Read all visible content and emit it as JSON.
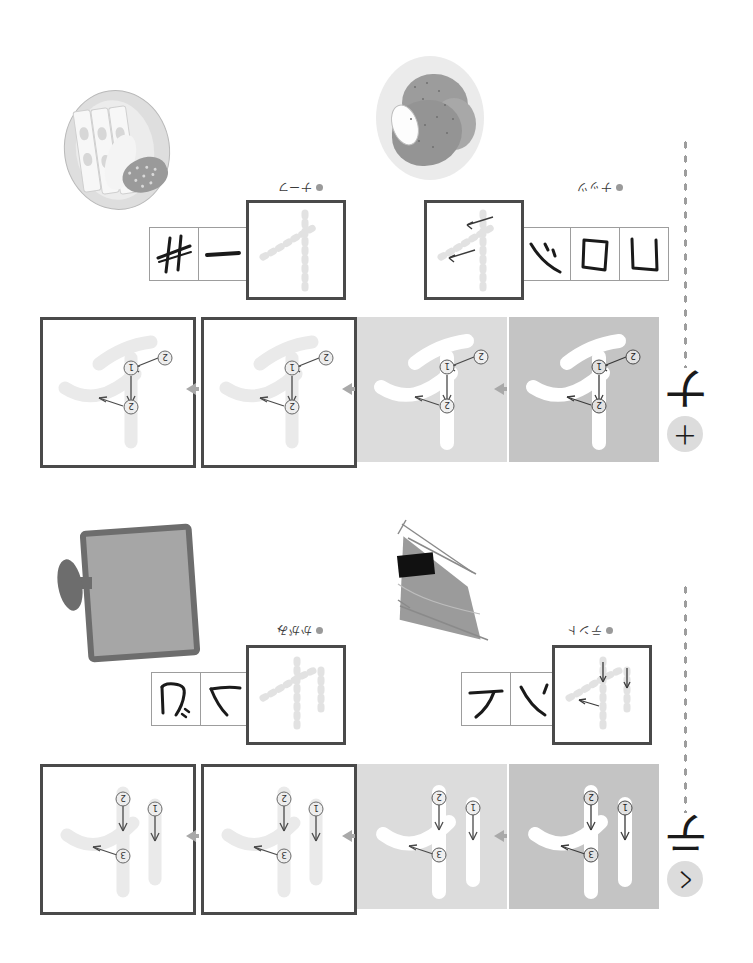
{
  "document": {
    "title": "Katakana stroke-order practice sheet",
    "orientation": "rotated-180",
    "background_color": "#ffffff"
  },
  "colors": {
    "ink": "#1a1a1a",
    "box_border": "#4a4a4a",
    "cell_border": "#9d9d9d",
    "ghost_stroke": "#e9e9e9",
    "panel_light": "#dcdcdc",
    "panel_dark": "#c4c4c4",
    "arrow": "#a9a9a9",
    "bullet": "#9a9a9a"
  },
  "sections": [
    {
      "id": "na",
      "headword": "ナ",
      "badge": "十",
      "illustrations": [
        {
          "name": "plate-with-sliced-food",
          "label": "＋ーカ"
        },
        {
          "name": "bread-on-oval-plate",
          "label": "ナッツ"
        }
      ],
      "word_labels": [
        {
          "text": "ナーフ",
          "bullet": true
        },
        {
          "text": "ナッツ",
          "bullet": true
        }
      ],
      "component_rows": [
        {
          "cells": [
            "井",
            "一"
          ]
        },
        {
          "cells": [
            "ヽゝ",
            "口",
            "凵"
          ]
        }
      ],
      "guide_boxes": [
        {
          "name": "ghost-guide-left"
        },
        {
          "name": "ghost-guide-right"
        }
      ],
      "panels": [
        {
          "style": "outlined",
          "strokes": 2,
          "markers": [
            "1",
            "2"
          ]
        },
        {
          "style": "outlined",
          "strokes": 2,
          "markers": [
            "1",
            "2"
          ]
        },
        {
          "style": "gray-light",
          "strokes": 2,
          "markers": [
            "1",
            "2"
          ]
        },
        {
          "style": "gray-dark",
          "strokes": 2,
          "markers": [
            "1",
            "2"
          ]
        }
      ],
      "stroke_count": 2
    },
    {
      "id": "te",
      "headword": "テ",
      "badge": "く",
      "illustrations": [
        {
          "name": "hand-mirror",
          "label": "かがみ"
        },
        {
          "name": "sail-kite",
          "label": "テント"
        }
      ],
      "word_labels": [
        {
          "text": "かがみ",
          "bullet": true
        },
        {
          "text": "テント",
          "bullet": true
        }
      ],
      "component_rows": [
        {
          "cells": [
            "冗",
            "へ"
          ]
        },
        {
          "cells": [
            "テ",
            "ヘ"
          ]
        }
      ],
      "guide_boxes": [
        {
          "name": "ghost-guide-left"
        },
        {
          "name": "ghost-guide-right"
        }
      ],
      "panels": [
        {
          "style": "outlined",
          "strokes": 3,
          "markers": [
            "1",
            "2",
            "3"
          ]
        },
        {
          "style": "outlined",
          "strokes": 3,
          "markers": [
            "1",
            "2",
            "3"
          ]
        },
        {
          "style": "gray-light",
          "strokes": 3,
          "markers": [
            "1",
            "2",
            "3"
          ]
        },
        {
          "style": "gray-dark",
          "strokes": 3,
          "markers": [
            "1",
            "2",
            "3"
          ]
        }
      ],
      "stroke_count": 3
    }
  ],
  "markers": {
    "one": "1",
    "two": "2",
    "three": "3"
  },
  "arrow_glyph": "◀"
}
